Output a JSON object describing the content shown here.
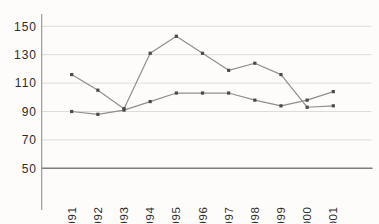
{
  "chart_data": {
    "type": "line",
    "title": "",
    "xlabel": "",
    "ylabel": "",
    "x": [
      "1991",
      "1992",
      "1993",
      "1994",
      "1995",
      "1996",
      "1997",
      "1998",
      "1999",
      "2000",
      "2001"
    ],
    "series": [
      {
        "name": "series-1",
        "values": [
          116,
          105,
          92,
          131,
          143,
          131,
          119,
          124,
          116,
          93,
          94
        ]
      },
      {
        "name": "series-2",
        "values": [
          90,
          88,
          91,
          97,
          103,
          103,
          103,
          98,
          94,
          98,
          104
        ]
      }
    ],
    "ylim": [
      50,
      150
    ],
    "yticks": [
      50,
      70,
      90,
      110,
      130,
      150
    ],
    "grid": true,
    "legend": false,
    "marker": "square",
    "colors": {
      "line": "#8f8f8f",
      "marker": "#4a4a4a",
      "gridline": "#dddcd8",
      "axis_line": "#9a9a9a",
      "baseline": "#7d7d7d",
      "tick_text": "#2e2c28",
      "background": "#fdfcfa"
    }
  }
}
